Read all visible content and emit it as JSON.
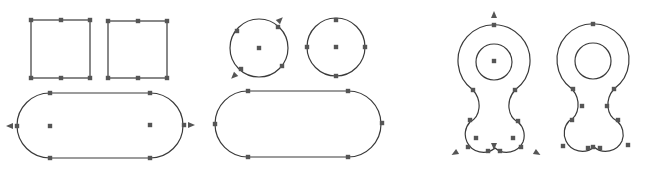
{
  "diagram": {
    "title": "",
    "colors": {
      "stroke": "#3a3a3a",
      "grip": "#555555",
      "background": "#ffffff"
    },
    "pairs": [
      {
        "name": "squares",
        "left": "square with corner and midpoint grips",
        "right": "square with corner and midpoint grips"
      },
      {
        "name": "circles",
        "left": "circle with center grip and tangent arrow grips",
        "right": "circle with center and quadrant grips"
      },
      {
        "name": "stadiums",
        "left": "rounded slot with center grips and arrow grips",
        "right": "rounded slot with quadrant and tangent grips"
      },
      {
        "name": "keyholes",
        "left": "keyhole profile with center grips and arrow grips",
        "right": "keyhole profile with vertex grips"
      }
    ]
  }
}
